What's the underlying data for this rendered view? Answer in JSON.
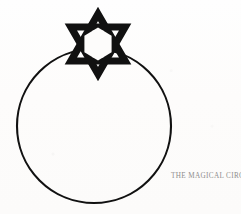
{
  "figure": {
    "title": "The Magical Circle",
    "background_color": "#fdfcfb",
    "ink_color": "#111111",
    "caption": {
      "text": "THE MAGICAL CIRCLE",
      "lead_letters": "TM C",
      "color": "#8e8d8c",
      "style": "small-caps",
      "position": "bottom-right"
    },
    "shapes": [
      {
        "name": "magic-circle",
        "type": "circle",
        "center_x": 94,
        "center_y": 126,
        "radius": 77,
        "stroke_color": "#111111",
        "stroke_width": 2.1,
        "fill": "none"
      },
      {
        "name": "hexagram-star",
        "type": "hexagram",
        "label": "Star of David",
        "center_x": 98,
        "center_y": 44,
        "outer_radius": 31,
        "top_apex_y": 13,
        "bottom_apex_y": 75,
        "left_point_x": 65,
        "right_point_x": 131,
        "stroke_color": "#111111",
        "stroke_width": 7.2,
        "fill": "none",
        "interlaced": true,
        "hollow_center": true
      }
    ]
  }
}
